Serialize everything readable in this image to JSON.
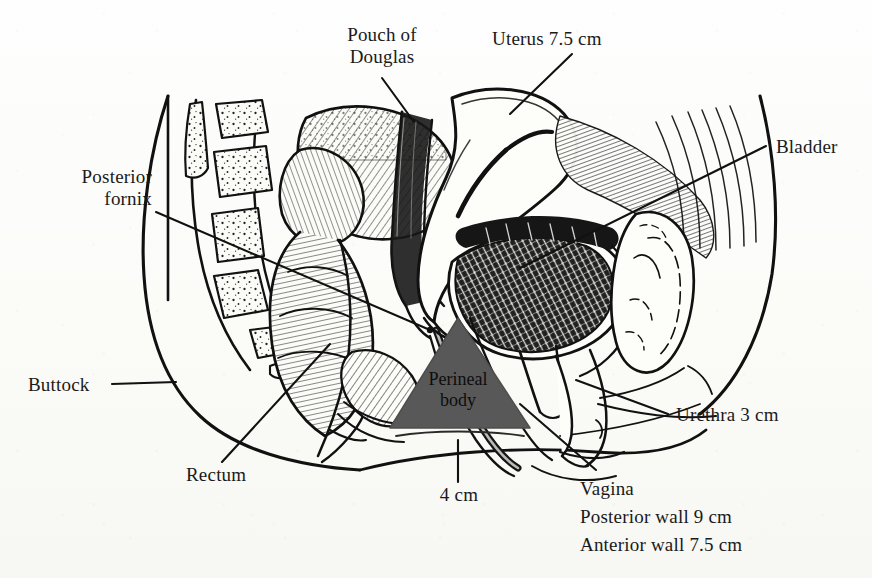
{
  "figure": {
    "kind": "anatomical-line-drawing",
    "view": "midsagittal section of the female pelvis",
    "background_color": "#fcfcfa",
    "ink_color": "#111111",
    "perineal_body_fill": "#585858"
  },
  "labels": {
    "pouch_of_douglas": "Pouch of\nDouglas",
    "uterus": "Uterus 7.5 cm",
    "bladder": "Bladder",
    "posterior_fornix": "Posterior\nfornix",
    "buttock": "Buttock",
    "rectum": "Rectum",
    "urethra": "Urethra 3 cm",
    "perineal_body": "Perineal\nbody",
    "perineal_body_measure": "4 cm",
    "vagina_line1": "Vagina",
    "vagina_line2": "Posterior wall 9 cm",
    "vagina_line3": "Anterior wall 7.5 cm"
  },
  "measurements": [
    {
      "structure": "Uterus",
      "value": "7.5 cm"
    },
    {
      "structure": "Urethra",
      "value": "3 cm"
    },
    {
      "structure": "Perineal body",
      "value": "4 cm"
    },
    {
      "structure": "Vagina posterior wall",
      "value": "9 cm"
    },
    {
      "structure": "Vagina anterior wall",
      "value": "7.5 cm"
    }
  ],
  "structures": [
    "Sacrum and coccyx (vertebral segments)",
    "Rectum and anal canal",
    "Pouch of Douglas",
    "Uterus (anteverted)",
    "Posterior fornix",
    "Bladder",
    "Urethra",
    "Vagina",
    "Perineal body",
    "Pubic symphysis",
    "Buttock / body outline"
  ]
}
